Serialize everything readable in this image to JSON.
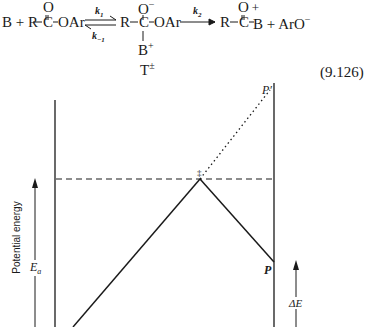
{
  "equation": {
    "reactant_B": "B + R",
    "carbonyl_O": "O",
    "ester_C": "C",
    "ester_tail": "OAr",
    "k1": "k",
    "k1_sub": "1",
    "k_minus1": "k",
    "k_minus1_sub": "−1",
    "intermediate_R": "R",
    "intermediate_O": "O",
    "intermediate_O_charge": "−",
    "intermediate_C": "C",
    "intermediate_tail": "OAr",
    "intermediate_B": "B",
    "intermediate_B_charge": "+",
    "intermediate_label": "T",
    "intermediate_label_charge": "±",
    "k2": "k",
    "k2_sub": "2",
    "product_R": "R",
    "product_O": "O",
    "product_O_charge": "+",
    "product_C": "C",
    "product_tail": "B + ArO",
    "product_tail_charge": "−",
    "number": "(9.126)"
  },
  "diagram": {
    "y_axis_label": "Potential energy",
    "activation_label": "E",
    "activation_sub": "a",
    "transition_state_symbol": "‡",
    "product_label": "P",
    "alt_product_label": "P′",
    "delta_label": "ΔE"
  }
}
